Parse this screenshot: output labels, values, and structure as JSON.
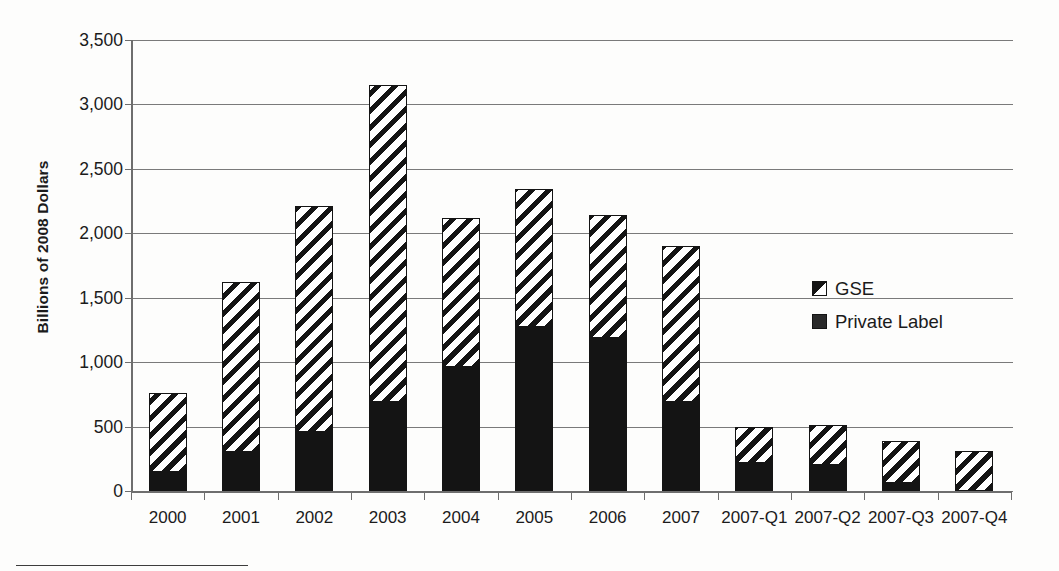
{
  "chart_data": {
    "type": "bar",
    "title": "",
    "subtitle": "",
    "xlabel": "",
    "ylabel": "Billions of 2008 Dollars",
    "ylim": [
      0,
      3500
    ],
    "ytick_step": 500,
    "ytick_labels": [
      "3,500",
      "3,000",
      "2,500",
      "2,000",
      "1,500",
      "1,000",
      "500",
      "0"
    ],
    "ytick_values": [
      3500,
      3000,
      2500,
      2000,
      1500,
      1000,
      500,
      0
    ],
    "grid": "horizontal",
    "stacked": true,
    "legend_position": "inside-right",
    "categories": [
      "2000",
      "2001",
      "2002",
      "2003",
      "2004",
      "2005",
      "2006",
      "2007",
      "2007-Q1",
      "2007-Q2",
      "2007-Q3",
      "2007-Q4"
    ],
    "series": [
      {
        "name": "Private Label",
        "pattern": "solid-black",
        "color": "#141414",
        "values": [
          150,
          300,
          460,
          690,
          960,
          1270,
          1190,
          690,
          220,
          200,
          60,
          0
        ]
      },
      {
        "name": "GSE",
        "pattern": "diagonal-hatch",
        "color": "#141414",
        "values": [
          610,
          1320,
          1750,
          2460,
          1160,
          1070,
          950,
          1210,
          280,
          310,
          330,
          310
        ]
      }
    ],
    "totals": [
      760,
      1620,
      2210,
      3150,
      2120,
      2340,
      2140,
      1900,
      500,
      510,
      390,
      310
    ]
  },
  "legend": {
    "items": [
      {
        "label": "GSE",
        "swatch": "diagonal-hatch-swatch"
      },
      {
        "label": "Private Label",
        "swatch": "solid-black-swatch"
      }
    ]
  }
}
